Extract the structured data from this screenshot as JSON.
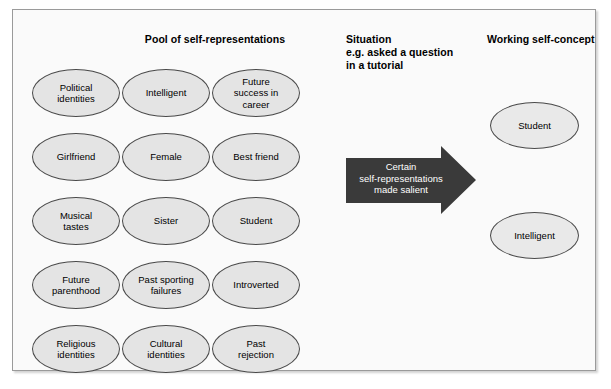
{
  "diagram": {
    "headings": {
      "pool": "Pool of self-representations",
      "situation": "Situation\ne.g. asked a question\nin a tutorial",
      "working": "Working self-concept"
    },
    "pool_items": [
      {
        "label": "Political\nidentities",
        "row": 0,
        "col": 0
      },
      {
        "label": "Intelligent",
        "row": 0,
        "col": 1
      },
      {
        "label": "Future\nsuccess in\ncareer",
        "row": 0,
        "col": 2
      },
      {
        "label": "Girlfriend",
        "row": 1,
        "col": 0
      },
      {
        "label": "Female",
        "row": 1,
        "col": 1
      },
      {
        "label": "Best friend",
        "row": 1,
        "col": 2
      },
      {
        "label": "Musical\ntastes",
        "row": 2,
        "col": 0
      },
      {
        "label": "Sister",
        "row": 2,
        "col": 1
      },
      {
        "label": "Student",
        "row": 2,
        "col": 2
      },
      {
        "label": "Future\nparenthood",
        "row": 3,
        "col": 0
      },
      {
        "label": "Past sporting\nfailures",
        "row": 3,
        "col": 1
      },
      {
        "label": "Introverted",
        "row": 3,
        "col": 2
      },
      {
        "label": "Religious\nidentities",
        "row": 4,
        "col": 0
      },
      {
        "label": "Cultural\nidentities",
        "row": 4,
        "col": 1
      },
      {
        "label": "Past\nrejection",
        "row": 4,
        "col": 2
      }
    ],
    "arrow": {
      "label": "Certain\nself-representations\nmade salient",
      "fill_color": "#3a3a3a",
      "text_color": "#ffffff",
      "direction": "right"
    },
    "working_self_concept_items": [
      {
        "label": "Student"
      },
      {
        "label": "Intelligent"
      }
    ],
    "colors": {
      "panel_background": "#fafafa",
      "ellipse_fill": "#e4e4e4",
      "ellipse_stroke": "#4a4a4a",
      "frame_stroke": "#9a9a9a",
      "text": "#000000"
    }
  }
}
